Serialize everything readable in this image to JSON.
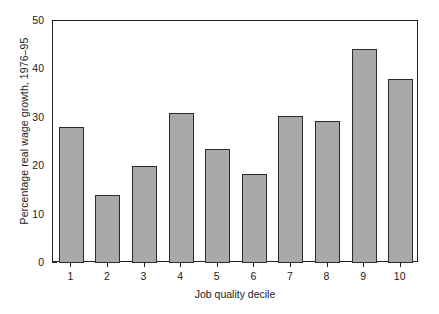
{
  "chart_data": {
    "type": "bar",
    "title": "",
    "subtitle": "",
    "xlabel": "Job quality decile",
    "ylabel": "Percentage real wage growth, 1976–95",
    "categories": [
      "1",
      "2",
      "3",
      "4",
      "5",
      "6",
      "7",
      "8",
      "9",
      "10"
    ],
    "values": [
      28.0,
      14.0,
      20.0,
      31.0,
      23.5,
      18.3,
      30.3,
      29.3,
      44.3,
      38.0
    ],
    "series": [
      {
        "name": "Percentage real wage growth, 1976-95",
        "values": [
          28.0,
          14.0,
          20.0,
          31.0,
          23.5,
          18.3,
          30.3,
          29.3,
          44.3,
          38.0
        ]
      }
    ],
    "ylim": [
      0,
      50
    ],
    "yticks": [
      0,
      10,
      20,
      30,
      40,
      50
    ],
    "ytick_labels": [
      "0",
      "10",
      "20",
      "30",
      "40",
      "50"
    ],
    "xtick_labels": [
      "1",
      "2",
      "3",
      "4",
      "5",
      "6",
      "7",
      "8",
      "9",
      "10"
    ],
    "grid": false,
    "legend": false,
    "legend_position": "none",
    "bar_fill_color": "#a9a9a9",
    "bar_edge_color": "#2b2b2b",
    "frame_color": "#222222",
    "background_color": "#ffffff"
  }
}
